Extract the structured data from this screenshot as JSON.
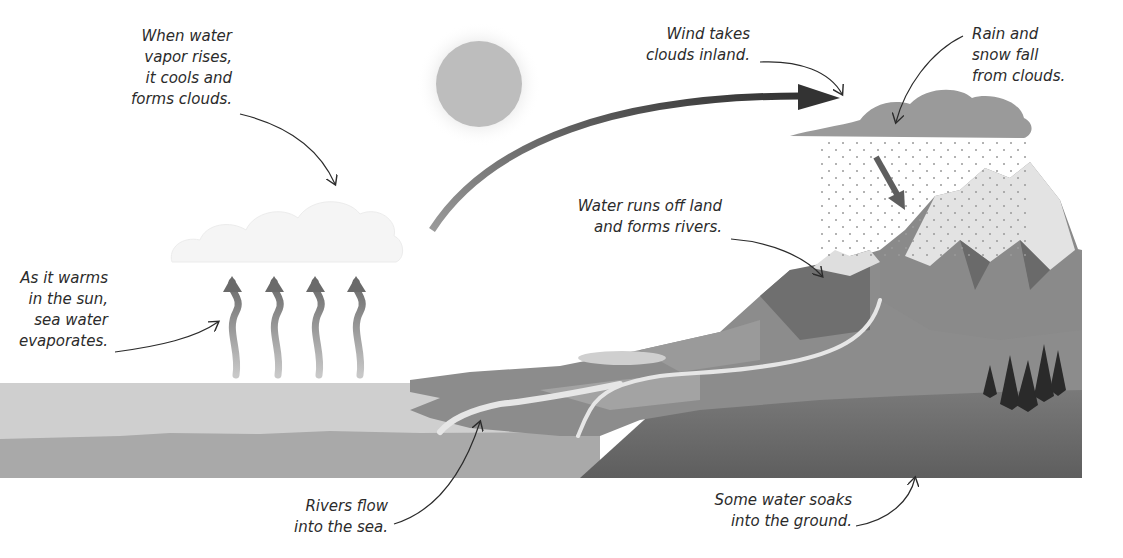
{
  "diagram": {
    "colors": {
      "background": "#ffffff",
      "text": "#2b2b2b",
      "sun": "#bdbdbd",
      "sea_light": "#cfcfcf",
      "sea_dark": "#a9a9a9",
      "land": "#8c8c8c",
      "ground": "#6e6e6e",
      "rain_cloud": "#9a9a9a",
      "wind_arrow": "#555555"
    },
    "labels": {
      "condensation": "When water\nvapor rises,\nit cools and\nforms clouds.",
      "evaporation": "As it warms\nin the sun,\nsea water\nevaporates.",
      "wind": "Wind takes\nclouds inland.",
      "precipitation": "Rain and\nsnow fall\nfrom clouds.",
      "runoff": "Water runs off land\nand forms rivers.",
      "rivers_to_sea": "Rivers flow\ninto the sea.",
      "infiltration": "Some water soaks\ninto the ground."
    },
    "icons": {
      "sun": "sun-icon",
      "evaporation_arrows": 4,
      "trees": 5
    }
  }
}
